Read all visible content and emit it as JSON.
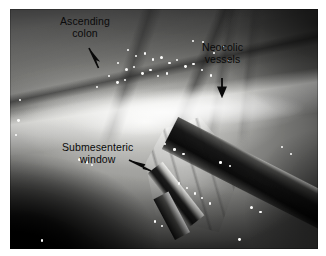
{
  "figure": {
    "type": "laparoscopic-surgical-photograph",
    "modality": "endoscopic video still",
    "color_mode": "grayscale",
    "background_color": "#ffffff"
  },
  "annotations": [
    {
      "id": "ascending-colon",
      "line1": "Ascending",
      "line2": "colon",
      "text": "Ascending colon",
      "arrow": "arrow-down-right",
      "text_x": 60,
      "text_y": 16,
      "arrow_x": 86,
      "arrow_y": 47
    },
    {
      "id": "neocolic-vessels",
      "line1": "Neocolic",
      "line2": "vessels",
      "text": "Neocolic vessels",
      "arrow": "arrow-down",
      "text_x": 202,
      "text_y": 42,
      "arrow_x": 216,
      "arrow_y": 76
    },
    {
      "id": "submesenteric-window",
      "line1": "Submesenteric",
      "line2": "window",
      "text": "Submesenteric window",
      "arrow": "arrow-down-right",
      "text_x": 62,
      "text_y": 142,
      "arrow_x": 128,
      "arrow_y": 158
    }
  ],
  "colors": {
    "annotation_text": "#0a0a0a",
    "arrow": "#0a0a0a",
    "page_background": "#ffffff",
    "image_bright": "#f2f2f0",
    "image_mid": "#9a9a97",
    "image_dark": "#111111"
  },
  "image_region": {
    "left": 10,
    "top": 9,
    "width": 308,
    "height": 240
  },
  "glints": [
    {
      "x": 38.0,
      "y": 16.5,
      "r": 1.2
    },
    {
      "x": 40.6,
      "y": 19.0,
      "r": 1.0
    },
    {
      "x": 43.4,
      "y": 18.0,
      "r": 1.3
    },
    {
      "x": 46.0,
      "y": 20.6,
      "r": 1.1
    },
    {
      "x": 48.6,
      "y": 19.4,
      "r": 1.5
    },
    {
      "x": 51.4,
      "y": 22.0,
      "r": 1.2
    },
    {
      "x": 54.0,
      "y": 21.0,
      "r": 1.0
    },
    {
      "x": 56.6,
      "y": 23.4,
      "r": 1.4
    },
    {
      "x": 59.2,
      "y": 22.4,
      "r": 1.1
    },
    {
      "x": 34.6,
      "y": 22.0,
      "r": 1.3
    },
    {
      "x": 37.2,
      "y": 24.6,
      "r": 1.5
    },
    {
      "x": 40.0,
      "y": 23.6,
      "r": 1.1
    },
    {
      "x": 42.6,
      "y": 26.2,
      "r": 1.4
    },
    {
      "x": 45.2,
      "y": 25.0,
      "r": 1.2
    },
    {
      "x": 47.8,
      "y": 27.6,
      "r": 1.0
    },
    {
      "x": 50.6,
      "y": 26.4,
      "r": 1.3
    },
    {
      "x": 31.8,
      "y": 27.4,
      "r": 1.2
    },
    {
      "x": 34.4,
      "y": 30.0,
      "r": 1.4
    },
    {
      "x": 37.0,
      "y": 29.0,
      "r": 1.0
    },
    {
      "x": 28.0,
      "y": 32.0,
      "r": 1.1
    },
    {
      "x": 62.0,
      "y": 25.0,
      "r": 1.0
    },
    {
      "x": 64.8,
      "y": 27.2,
      "r": 1.2
    },
    {
      "x": 59.0,
      "y": 13.0,
      "r": 1.0
    },
    {
      "x": 66.0,
      "y": 18.0,
      "r": 0.9
    },
    {
      "x": 70.4,
      "y": 20.8,
      "r": 1.0
    },
    {
      "x": 62.2,
      "y": 13.4,
      "r": 1.1
    },
    {
      "x": 69.0,
      "y": 15.0,
      "r": 0.9
    },
    {
      "x": 2.4,
      "y": 46.0,
      "r": 1.4
    },
    {
      "x": 1.6,
      "y": 52.0,
      "r": 1.0
    },
    {
      "x": 3.0,
      "y": 37.4,
      "r": 1.0
    },
    {
      "x": 22.0,
      "y": 62.0,
      "r": 1.6
    },
    {
      "x": 24.6,
      "y": 63.4,
      "r": 1.2
    },
    {
      "x": 26.4,
      "y": 64.6,
      "r": 1.0
    },
    {
      "x": 53.0,
      "y": 58.0,
      "r": 1.3
    },
    {
      "x": 56.0,
      "y": 60.0,
      "r": 1.1
    },
    {
      "x": 50.0,
      "y": 56.0,
      "r": 1.0
    },
    {
      "x": 54.4,
      "y": 72.0,
      "r": 1.4
    },
    {
      "x": 57.0,
      "y": 74.0,
      "r": 1.1
    },
    {
      "x": 59.6,
      "y": 76.4,
      "r": 1.3
    },
    {
      "x": 62.0,
      "y": 78.4,
      "r": 1.0
    },
    {
      "x": 64.6,
      "y": 80.6,
      "r": 1.2
    },
    {
      "x": 68.0,
      "y": 63.4,
      "r": 1.3
    },
    {
      "x": 71.0,
      "y": 65.0,
      "r": 1.0
    },
    {
      "x": 78.0,
      "y": 82.0,
      "r": 1.5
    },
    {
      "x": 81.0,
      "y": 84.0,
      "r": 1.1
    },
    {
      "x": 46.6,
      "y": 88.0,
      "r": 1.3
    },
    {
      "x": 49.0,
      "y": 90.0,
      "r": 1.0
    },
    {
      "x": 88.0,
      "y": 57.0,
      "r": 1.2
    },
    {
      "x": 91.0,
      "y": 60.0,
      "r": 1.0
    },
    {
      "x": 74.0,
      "y": 95.6,
      "r": 1.4
    },
    {
      "x": 10.0,
      "y": 96.0,
      "r": 1.2
    }
  ]
}
